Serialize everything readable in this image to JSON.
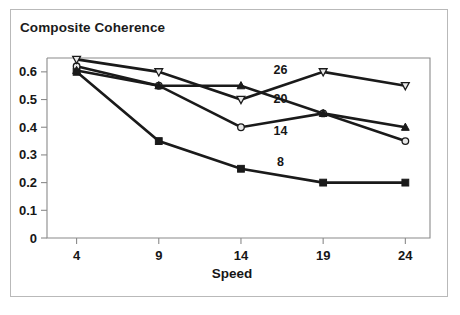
{
  "figure": {
    "title": "Composite Coherence",
    "border_color": "#b9b9b9",
    "background": "#ffffff",
    "ink_color": "#1a1a1a"
  },
  "chart_data": {
    "type": "line",
    "title": "Composite Coherence",
    "xlabel": "Speed",
    "ylabel": "",
    "x": [
      4,
      9,
      14,
      19,
      24
    ],
    "xticklabels": [
      "4",
      "9",
      "14",
      "19",
      "24"
    ],
    "yticklabels": [
      "0",
      "0.1",
      "0.2",
      "0.3",
      "0.4",
      "0.5",
      "0.6"
    ],
    "yticks": [
      0,
      0.1,
      0.2,
      0.3,
      0.4,
      0.5,
      0.6
    ],
    "xlim": [
      2.2,
      25.5
    ],
    "ylim": [
      0,
      0.65
    ],
    "grid": false,
    "legend": "inline-annotations",
    "series": [
      {
        "name": "8",
        "label": "8",
        "marker": "filled-square",
        "values": [
          0.6,
          0.35,
          0.25,
          0.2,
          0.2
        ],
        "annotation_at": {
          "x": 16.4,
          "y": 0.275
        }
      },
      {
        "name": "14",
        "label": "14",
        "marker": "open-circle",
        "values": [
          0.62,
          0.55,
          0.4,
          0.45,
          0.35
        ],
        "annotation_at": {
          "x": 16.4,
          "y": 0.388
        }
      },
      {
        "name": "20",
        "label": "20",
        "marker": "filled-triangle-up",
        "values": [
          0.605,
          0.55,
          0.55,
          0.45,
          0.4
        ],
        "annotation_at": {
          "x": 16.4,
          "y": 0.505
        }
      },
      {
        "name": "26",
        "label": "26",
        "marker": "open-triangle-down",
        "values": [
          0.645,
          0.6,
          0.5,
          0.6,
          0.55
        ],
        "annotation_at": {
          "x": 16.4,
          "y": 0.608
        }
      }
    ],
    "axis_titles": {
      "x": "Speed"
    }
  }
}
